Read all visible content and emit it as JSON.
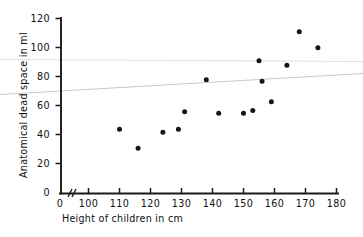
{
  "chart_data": {
    "type": "scatter",
    "title": "",
    "xlabel": "Height of children in cm",
    "ylabel": "Anatomical dead space in ml",
    "xlim": [
      100,
      180
    ],
    "ylim": [
      0,
      120
    ],
    "xticks": [
      100,
      110,
      120,
      130,
      140,
      150,
      160,
      170,
      180
    ],
    "xtick_labels": [
      "100",
      "110",
      "120",
      "130",
      "140",
      "150",
      "160",
      "170",
      "180"
    ],
    "x_origin_label": "0",
    "yticks": [
      0,
      20,
      40,
      60,
      80,
      100,
      120
    ],
    "ytick_labels": [
      "0",
      "20",
      "40",
      "60",
      "80",
      "100",
      "120"
    ],
    "x_axis_break": true,
    "grid": false,
    "legend": null,
    "points": [
      {
        "x": 110,
        "y": 44
      },
      {
        "x": 116,
        "y": 31
      },
      {
        "x": 124,
        "y": 42
      },
      {
        "x": 129,
        "y": 44
      },
      {
        "x": 131,
        "y": 56
      },
      {
        "x": 138,
        "y": 78
      },
      {
        "x": 142,
        "y": 55
      },
      {
        "x": 150,
        "y": 55
      },
      {
        "x": 153,
        "y": 57
      },
      {
        "x": 155,
        "y": 91
      },
      {
        "x": 156,
        "y": 77
      },
      {
        "x": 159,
        "y": 63
      },
      {
        "x": 164,
        "y": 88
      },
      {
        "x": 168,
        "y": 111
      },
      {
        "x": 174,
        "y": 100
      }
    ],
    "trend_lines": [
      {
        "name": "regression-line",
        "x1": 100,
        "y1": 69,
        "x2": 180,
        "y2": 76,
        "color": "#c9c9c9"
      },
      {
        "name": "faint-guide-line",
        "x1": 100,
        "y1": 92,
        "x2": 180,
        "y2": 93,
        "color": "#dcdcdc"
      }
    ]
  },
  "axes": {
    "y_title": "Anatomical dead space in ml",
    "x_title": "Height of children in cm"
  }
}
